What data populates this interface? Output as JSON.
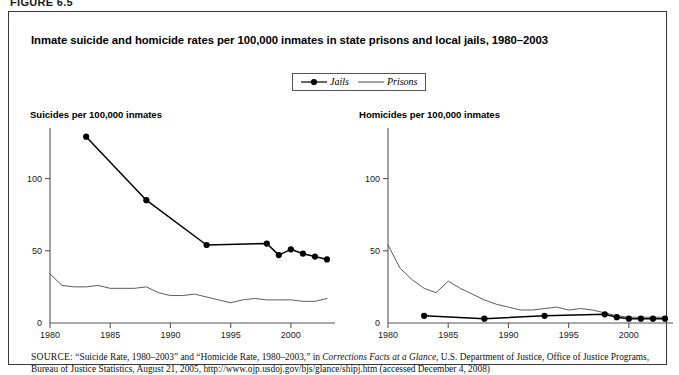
{
  "figure": {
    "label": "FIGURE 6.5",
    "title": "Inmate suicide and homicide rates per 100,000 inmates in state prisons and local jails, 1980–2003"
  },
  "legend": {
    "position": "top-center",
    "items": [
      {
        "label": "Jails",
        "marker": "circle-line",
        "color": "#000000"
      },
      {
        "label": "Prisons",
        "marker": "line",
        "color": "#555555"
      }
    ]
  },
  "source": {
    "prefix": "SOURCE:",
    "part1": " “Suicide Rate, 1980–2003” and “Homicide Rate, 1980–2003,” in ",
    "italic1": "Corrections Facts at a Glance",
    "part2": ", U.S. Department of Justice, Office of Justice Programs, Bureau of Justice Statistics, August 21, 2005, http://www.ojp.usdoj.gov/bjs/glance/shipj.htm (accessed December 4, 2008)"
  },
  "chart_data": [
    {
      "id": "suicides",
      "type": "line",
      "title": "Suicides per 100,000 inmates",
      "ylabel": "Suicides per 100,000 inmates",
      "xlabel": "",
      "xlim": [
        1980,
        2003
      ],
      "ylim": [
        0,
        135
      ],
      "yticks": [
        0,
        50,
        100
      ],
      "ytick_labels": [
        "0",
        "50",
        "100"
      ],
      "xticks": [
        1980,
        1985,
        1990,
        1995,
        2000
      ],
      "xtick_labels": [
        "1980",
        "1985",
        "1990",
        "1995",
        "2000"
      ],
      "grid": false,
      "series": [
        {
          "name": "Jails",
          "marker": "circle",
          "color": "#000000",
          "x": [
            1983,
            1988,
            1993,
            1998,
            1999,
            2000,
            2001,
            2002,
            2003
          ],
          "values": [
            129,
            85,
            54,
            55,
            47,
            51,
            48,
            46,
            44
          ]
        },
        {
          "name": "Prisons",
          "marker": "none",
          "color": "#555555",
          "x": [
            1980,
            1981,
            1982,
            1983,
            1984,
            1985,
            1986,
            1987,
            1988,
            1989,
            1990,
            1991,
            1992,
            1993,
            1994,
            1995,
            1996,
            1997,
            1998,
            1999,
            2000,
            2001,
            2002,
            2003
          ],
          "values": [
            34,
            26,
            25,
            25,
            26,
            24,
            24,
            24,
            25,
            21,
            19,
            19,
            20,
            18,
            16,
            14,
            16,
            17,
            16,
            16,
            16,
            15,
            15,
            17
          ]
        }
      ]
    },
    {
      "id": "homicides",
      "type": "line",
      "title": "Homicides per 100,000 inmates",
      "ylabel": "Homicides per 100,000 inmates",
      "xlabel": "",
      "xlim": [
        1980,
        2003
      ],
      "ylim": [
        0,
        135
      ],
      "yticks": [
        0,
        50,
        100
      ],
      "ytick_labels": [
        "0",
        "50",
        "100"
      ],
      "xticks": [
        1980,
        1985,
        1990,
        1995,
        2000
      ],
      "xtick_labels": [
        "1980",
        "1985",
        "1990",
        "1995",
        "2000"
      ],
      "grid": false,
      "series": [
        {
          "name": "Jails",
          "marker": "circle",
          "color": "#000000",
          "x": [
            1983,
            1988,
            1993,
            1998,
            1999,
            2000,
            2001,
            2002,
            2003
          ],
          "values": [
            5,
            3,
            5,
            6,
            4,
            3,
            3,
            3,
            3
          ]
        },
        {
          "name": "Prisons",
          "marker": "none",
          "color": "#555555",
          "x": [
            1980,
            1981,
            1982,
            1983,
            1984,
            1985,
            1986,
            1987,
            1988,
            1989,
            1990,
            1991,
            1992,
            1993,
            1994,
            1995,
            1996,
            1997,
            1998,
            1999,
            2000,
            2001,
            2002,
            2003
          ],
          "values": [
            54,
            38,
            30,
            24,
            21,
            29,
            24,
            20,
            16,
            13,
            11,
            9,
            9,
            10,
            11,
            9,
            10,
            9,
            7,
            5,
            4,
            4,
            4,
            4
          ]
        }
      ]
    }
  ]
}
